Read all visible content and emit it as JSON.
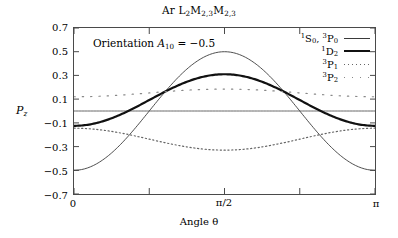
{
  "figure": {
    "title_prefix": "Ar L",
    "title": "Ar L2M2,3M2,3",
    "annotation": "Orientation  A10 = −0.5",
    "annotation_text": "Orientation",
    "annotation_symbol": "A",
    "annotation_sub": "10",
    "annotation_value": "= −0.5"
  },
  "axes": {
    "ylabel": "P",
    "ylabel_sub": "z",
    "xlabel": "Angle θ",
    "yticks": [
      "0.7",
      "0.5",
      "0.3",
      "0.1",
      "−0.1",
      "−0.3",
      "−0.5",
      "−0.7"
    ],
    "xticks": [
      "0",
      "π/2",
      "π"
    ]
  },
  "legend": {
    "entries": [
      {
        "label": "1S0, 3P0",
        "style": "solid-thin",
        "name": "legend-entry-1s0-3p0"
      },
      {
        "label": "1D2",
        "style": "solid-thick",
        "name": "legend-entry-1d2"
      },
      {
        "label": "3P1",
        "style": "dotted-fine",
        "name": "legend-entry-3p1"
      },
      {
        "label": "3P2",
        "style": "dotted-sparse",
        "name": "legend-entry-3p2"
      }
    ]
  },
  "chart_data": {
    "type": "line",
    "title": "Ar L2M2,3M2,3",
    "xlabel": "Angle θ",
    "ylabel": "Pz",
    "xlim": [
      0,
      3.14159
    ],
    "ylim": [
      -0.7,
      0.7
    ],
    "xticks": [
      0,
      1.5708,
      3.14159
    ],
    "xticklabels": [
      "0",
      "π/2",
      "π"
    ],
    "yticks": [
      -0.7,
      -0.5,
      -0.3,
      -0.1,
      0.1,
      0.3,
      0.5,
      0.7
    ],
    "grid": false,
    "legend_position": "top-right",
    "annotations": [
      "Orientation A10 = −0.5"
    ],
    "series": [
      {
        "name": "1S0, 3P0 (varying)",
        "style": "solid-thin",
        "color": "#3a3a3a",
        "form": "-0.5*cos(2*theta)",
        "x": [
          0,
          0.3927,
          0.7854,
          1.1781,
          1.5708,
          1.9635,
          2.3562,
          2.7489,
          3.14159
        ],
        "y": [
          -0.5,
          -0.354,
          0.0,
          0.354,
          0.5,
          0.354,
          0.0,
          -0.354,
          -0.5
        ]
      },
      {
        "name": "1S0, 3P0 (flat)",
        "style": "solid-thin",
        "color": "#555555",
        "form": "0",
        "x": [
          0,
          1.5708,
          3.14159
        ],
        "y": [
          0.0,
          0.0,
          0.0
        ]
      },
      {
        "name": "1D2",
        "style": "solid-thick",
        "color": "#111111",
        "form": "0.0925 - 0.2175*cos(2*theta)",
        "x": [
          0,
          0.3927,
          0.7854,
          1.1781,
          1.5708,
          1.9635,
          2.3562,
          2.7489,
          3.14159
        ],
        "y": [
          -0.125,
          -0.061,
          0.0925,
          0.246,
          0.31,
          0.246,
          0.0925,
          -0.061,
          -0.125
        ]
      },
      {
        "name": "3P1",
        "style": "dotted-fine",
        "color": "#666666",
        "form": "-0.2375 + 0.0925*cos(2*theta)",
        "x": [
          0,
          0.3927,
          0.7854,
          1.1781,
          1.5708,
          1.9635,
          2.3562,
          2.7489,
          3.14159
        ],
        "y": [
          -0.145,
          -0.172,
          -0.2375,
          -0.303,
          -0.33,
          -0.303,
          -0.2375,
          -0.172,
          -0.145
        ]
      },
      {
        "name": "3P2",
        "style": "dotted-sparse",
        "color": "#888888",
        "form": "0.1525 - 0.0325*cos(2*theta)",
        "x": [
          0,
          0.3927,
          0.7854,
          1.1781,
          1.5708,
          1.9635,
          2.3562,
          2.7489,
          3.14159
        ],
        "y": [
          0.12,
          0.129,
          0.1525,
          0.176,
          0.185,
          0.176,
          0.1525,
          0.129,
          0.12
        ]
      }
    ]
  }
}
